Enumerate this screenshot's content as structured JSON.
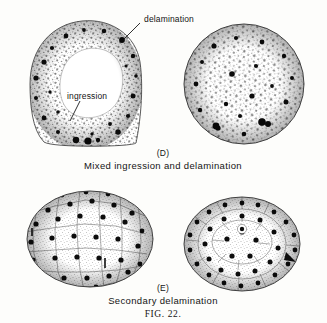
{
  "figure": {
    "figure_number": "FIG. 22.",
    "annotations": [
      {
        "id": "delamination",
        "text": "delamination"
      },
      {
        "id": "ingression",
        "text": "ingression"
      }
    ],
    "panels": [
      {
        "id": "D",
        "letter": "(D)",
        "caption": "Mixed ingression and delamination",
        "drawings": [
          {
            "id": "d-left",
            "description": "ring of stippled cells around clear blastocoel"
          },
          {
            "id": "d-right",
            "description": "solid densely stippled disc"
          }
        ]
      },
      {
        "id": "E",
        "letter": "(E)",
        "caption": "Secondary delamination",
        "drawings": [
          {
            "id": "e-left",
            "description": "oval polygonal cell mosaic with dark nuclei"
          },
          {
            "id": "e-right",
            "description": "disc with inner concentric layer and dark nuclei"
          }
        ]
      }
    ],
    "colors": {
      "background": "#fdfdfb",
      "ink": "#141414",
      "cell_outline": "#6b6b6b",
      "nucleus": "#101010"
    }
  }
}
